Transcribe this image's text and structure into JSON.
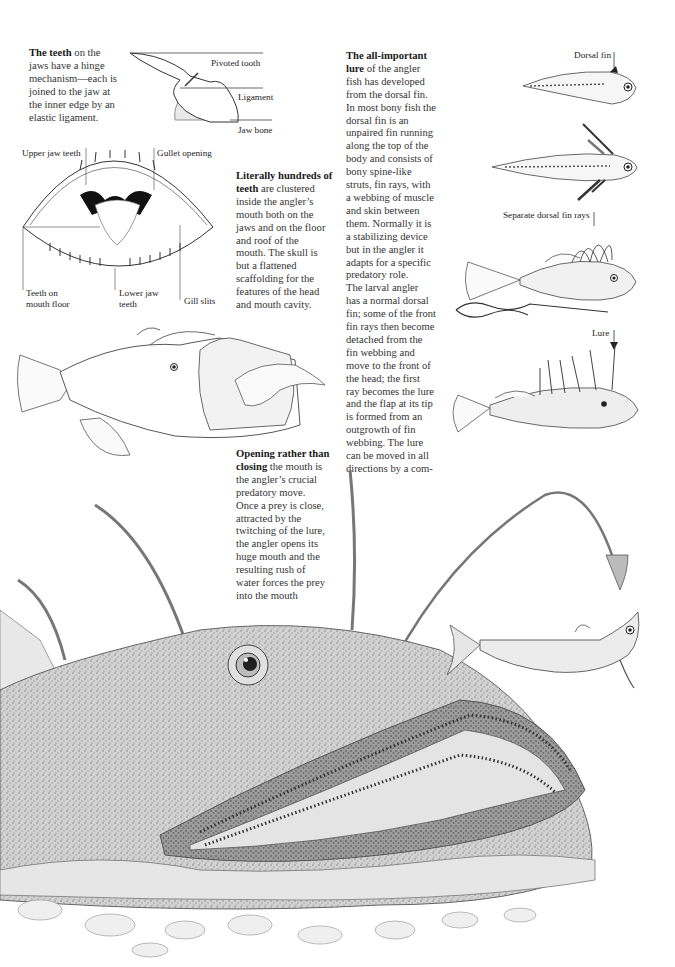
{
  "captions": {
    "teeth_hinge": {
      "lead": "The teeth",
      "lines": [
        "on the",
        "jaws have a hinge",
        "mechanism—each is",
        "joined to the jaw at",
        "the inner edge by an",
        "elastic ligament."
      ]
    },
    "hundreds_teeth": {
      "lead_line1": "Literally hundreds of",
      "lead_line2": "teeth",
      "lines": [
        "are clustered",
        "inside the angler’s",
        "mouth both on the",
        "jaws and on the floor",
        "and roof of the",
        "mouth. The skull is",
        "but a flattened",
        "scaffolding for the",
        "features of the head",
        "and mouth cavity."
      ]
    },
    "lure": {
      "lead_line1": "The all-important",
      "lead_line2": "lure",
      "lines": [
        "of the angler",
        "fish has developed",
        "from the dorsal fin.",
        "In most bony fish the",
        "dorsal fin is an",
        "unpaired fin running",
        "along the top of the",
        "body and consists of",
        "bony spine-like",
        "struts, fin rays, with",
        "a webbing of muscle",
        "and skin between",
        "them. Normally it is",
        "a stabilizing device",
        "but in the angler it",
        "adapts for a specific",
        "predatory role.",
        "The larval angler",
        "has a normal dorsal",
        "fin; some of the front",
        "fin rays then become",
        "detached from the",
        "fin webbing and",
        "move to the front of",
        "the head; the first",
        "ray becomes the lure",
        "and the flap at its tip",
        "is formed from an",
        "outgrowth of fin",
        "webbing. The lure",
        "can be moved in all",
        "directions by a com-",
        "plex of muscles."
      ]
    },
    "opening_mouth": {
      "lead_line1": "Opening rather than",
      "lead_line2": "closing",
      "lines": [
        "the mouth is",
        "the angler’s crucial",
        "predatory move.",
        "Once a prey is close,",
        "attracted by the",
        "twitching of the lure,",
        "the angler opens its",
        "huge mouth and the",
        "resulting rush of",
        "water forces the prey",
        "into the mouth",
        "cavity."
      ]
    }
  },
  "diagram_labels": {
    "pivoted_tooth": "Pivoted tooth",
    "ligament": "Ligament",
    "jaw_bone": "Jaw bone",
    "upper_jaw_teeth": "Upper jaw teeth",
    "gullet_opening": "Gullet opening",
    "teeth_on_mouth_floor_1": "Teeth on",
    "teeth_on_mouth_floor_2": "mouth floor",
    "lower_jaw_teeth_1": "Lower jaw",
    "lower_jaw_teeth_2": "teeth",
    "gill_slits": "Gill slits",
    "dorsal_fin": "Dorsal fin",
    "separate_dorsal_fin_rays": "Separate dorsal fin rays",
    "lure": "Lure"
  },
  "illustrations": [
    "tooth-hinge-diagram",
    "open-mouth-diagram",
    "angler-swallowing-prey",
    "larval-angler-stage-1",
    "larval-angler-stage-2",
    "juvenile-angler-fin-rays",
    "adult-angler-lure",
    "angler-head-large",
    "prey-fish"
  ]
}
